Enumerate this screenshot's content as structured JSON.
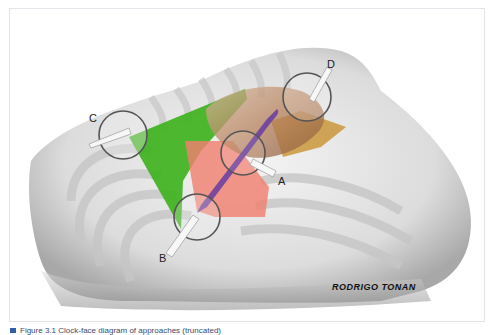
{
  "figure": {
    "labels": {
      "a": "A",
      "b": "B",
      "c": "C",
      "d": "D"
    },
    "signature": "RODRIGO TONAN",
    "colors": {
      "green_zone": "#3fb21f",
      "red_zone": "#f08070",
      "purple_zone": "#6a3fa0",
      "orange_zone": "#c8902a",
      "skin": "#b98a6a",
      "bone": "#e6e6e6"
    },
    "clock_faces": [
      {
        "id": "A",
        "center": [
          242,
          152
        ]
      },
      {
        "id": "B",
        "center": [
          196,
          216
        ]
      },
      {
        "id": "C",
        "center": [
          122,
          134
        ]
      },
      {
        "id": "D",
        "center": [
          306,
          96
        ]
      }
    ]
  },
  "caption": {
    "text": "Figure 3.1  Clock-face diagram of approaches (truncated)"
  }
}
